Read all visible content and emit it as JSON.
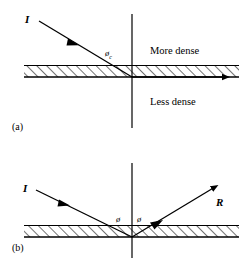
{
  "figure": {
    "panels": [
      {
        "id": "(a)",
        "incident_ray_label": "I",
        "angle_label": "ø",
        "angle_subscript": "c",
        "upper_medium_label": "More dense",
        "lower_medium_label": "Less dense",
        "refracted_ray_label": ""
      },
      {
        "id": "(b)",
        "incident_ray_label": "I",
        "reflected_ray_label": "R",
        "angle_label_left": "ø",
        "angle_label_right": "ø"
      }
    ]
  },
  "colors": {
    "ink": "#000000",
    "background": "#ffffff"
  }
}
